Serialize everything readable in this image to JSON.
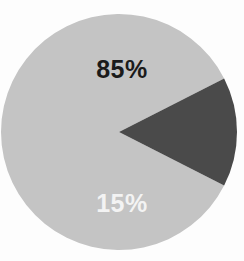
{
  "background_color": "#fdfdfd",
  "chart_data": {
    "type": "pie",
    "title": "",
    "subtitle": "",
    "xlabel": "",
    "ylabel": "",
    "grid": false,
    "legend_position": "none",
    "center": {
      "cx": 119,
      "cy": 132
    },
    "radius": 118,
    "start_angle_deg": 117,
    "direction": "clockwise",
    "categories": [
      "85%",
      "15%"
    ],
    "values": [
      85,
      15
    ],
    "slices": [
      {
        "label": "85%",
        "value": 85,
        "color": "#c4c4c4",
        "label_color": "#1b1b1b",
        "sweep_deg": 306
      },
      {
        "label": "15%",
        "value": 15,
        "color": "#4a4a4a",
        "label_color": "#f3f3f3",
        "sweep_deg": 54
      }
    ],
    "annotations": []
  },
  "labels": {
    "major": "85%",
    "minor": "15%"
  }
}
